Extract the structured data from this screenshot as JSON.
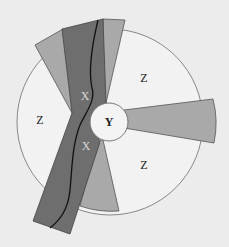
{
  "diagram": {
    "colors": {
      "background": "#ececec",
      "circle_fill": "#f2f2f2",
      "circle_stroke": "#888888",
      "light_wedge": "#a9a9a9",
      "dark_band": "#6e6e6e",
      "center_fill": "#f4f4f4",
      "curve": "#111111",
      "label_dark": "#222222",
      "label_light": "#d8d8d8"
    },
    "labels": {
      "center": "Y",
      "band_upper": "X",
      "band_lower": "X",
      "zone_upper_right": "Z",
      "zone_left": "Z",
      "zone_lower_right": "Z"
    }
  }
}
